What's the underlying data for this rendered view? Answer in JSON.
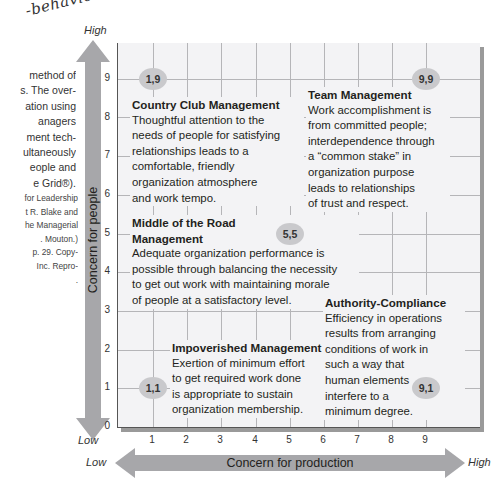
{
  "handwritten_note": "-behavioral",
  "side_text": {
    "lines": [
      "method of",
      "s. The over-",
      "ation using",
      "anagers",
      "ment tech-",
      "ultaneously",
      "eople and",
      "e Grid®)."
    ]
  },
  "side_source": {
    "lines": [
      "for Leadership",
      "t R. Blake and",
      "he Managerial",
      ". Mouton.)",
      "p. 29. Copy-",
      "Inc. Repro-",
      "."
    ]
  },
  "y_axis": {
    "label": "Concern for people",
    "high": "High",
    "low": "Low",
    "ticks": [
      "0",
      "1",
      "2",
      "3",
      "4",
      "5",
      "6",
      "7",
      "8",
      "9"
    ]
  },
  "x_axis": {
    "label": "Concern for production",
    "high": "High",
    "low": "Low",
    "ticks": [
      "1",
      "2",
      "3",
      "4",
      "5",
      "6",
      "7",
      "8",
      "9"
    ]
  },
  "points": [
    {
      "label": "1,9",
      "x": 1,
      "y": 9
    },
    {
      "label": "9,9",
      "x": 9,
      "y": 9
    },
    {
      "label": "5,5",
      "x": 5,
      "y": 5
    },
    {
      "label": "1,1",
      "x": 1,
      "y": 1
    },
    {
      "label": "9,1",
      "x": 9,
      "y": 1
    }
  ],
  "styles": {
    "country_club": {
      "title": "Country Club Management",
      "desc": [
        "Thoughtful attention to the",
        "needs of people for satisfying",
        "relationships leads to a",
        "comfortable, friendly",
        "organization atmosphere",
        "and work tempo."
      ]
    },
    "team": {
      "title": "Team Management",
      "desc": [
        "Work accomplishment is",
        "from committed people;",
        "interdependence through",
        "a “common stake” in",
        "organization purpose",
        "leads to relationships",
        "of trust and respect."
      ]
    },
    "middle": {
      "title": [
        "Middle of the Road",
        "Management"
      ],
      "desc": [
        "Adequate organization performance is",
        "possible through balancing the necessity",
        "to get out work with maintaining morale",
        "of people at a satisfactory level."
      ]
    },
    "authority": {
      "title": "Authority-Compliance",
      "desc": [
        "Efficiency in operations",
        "results from arranging",
        "conditions of work in",
        "such a way that",
        "human elements",
        "interfere to a",
        "minimum degree."
      ]
    },
    "impoverished": {
      "title": "Impoverished Management",
      "desc": [
        "Exertion of minimum effort",
        "to get required work done",
        "is appropriate to sustain",
        "organization membership."
      ]
    }
  },
  "colors": {
    "arrow": "#a7a7aa",
    "plot_bg": "#f3f3f5",
    "grid": "#b5b5b8",
    "dot": "#c9c9cc"
  }
}
